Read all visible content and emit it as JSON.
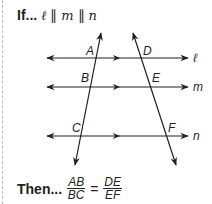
{
  "premise": {
    "label": "If...",
    "statement": [
      "ℓ",
      "∥",
      "m",
      "∥",
      "n"
    ]
  },
  "conclusion": {
    "label": "Then...",
    "left_fraction": {
      "numerator": "AB",
      "denominator": "BC"
    },
    "equals": "=",
    "right_fraction": {
      "numerator": "DE",
      "denominator": "EF"
    }
  },
  "diagram": {
    "lines": [
      {
        "name": "ℓ",
        "y": 58
      },
      {
        "name": "m",
        "y": 87
      },
      {
        "name": "n",
        "y": 136
      }
    ],
    "points": {
      "A": "A",
      "B": "B",
      "C": "C",
      "D": "D",
      "E": "E",
      "F": "F"
    },
    "line_labels": {
      "l": "ℓ",
      "m": "m",
      "n": "n"
    }
  }
}
